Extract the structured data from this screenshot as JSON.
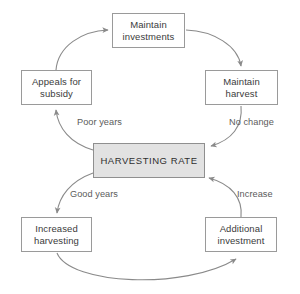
{
  "diagram": {
    "colors": {
      "background": "#ffffff",
      "node_fill": "#ffffff",
      "node_stroke": "#9a9a9a",
      "center_fill": "#e2e2e2",
      "center_stroke": "#8f8f8f",
      "edge_stroke": "#8a8a8a",
      "text": "#3b3b3b",
      "edge_label_text": "#5b5b5b"
    },
    "nodes": [
      {
        "id": "maintain-investments",
        "label": "Maintain\ninvestments",
        "type": "process",
        "x": 112,
        "y": 13,
        "w": 73,
        "h": 35
      },
      {
        "id": "appeals-for-subsidy",
        "label": "Appeals for\nsubsidy",
        "type": "process",
        "x": 21,
        "y": 70,
        "w": 71,
        "h": 35
      },
      {
        "id": "maintain-harvest",
        "label": "Maintain\nharvest",
        "type": "process",
        "x": 205,
        "y": 70,
        "w": 73,
        "h": 35
      },
      {
        "id": "harvesting-rate",
        "label": "HARVESTING RATE",
        "type": "central",
        "x": 93,
        "y": 143,
        "w": 112,
        "h": 35
      },
      {
        "id": "increased-harvesting",
        "label": "Increased\nharvesting",
        "type": "process",
        "x": 21,
        "y": 217,
        "w": 71,
        "h": 35
      },
      {
        "id": "additional-investment",
        "label": "Additional\ninvestment",
        "type": "process",
        "x": 205,
        "y": 217,
        "w": 72,
        "h": 35
      }
    ],
    "edges": [
      {
        "id": "appeals-to-investments",
        "from": "appeals-for-subsidy",
        "to": "maintain-investments",
        "label": "",
        "path": "M 56 70 C 58 46 82 31 108 30"
      },
      {
        "id": "investments-to-harvest",
        "from": "maintain-investments",
        "to": "maintain-harvest",
        "label": "",
        "path": "M 186 30 C 214 31 238 46 241 66"
      },
      {
        "id": "harvest-to-rate",
        "from": "maintain-harvest",
        "to": "harvesting-rate",
        "label": "No change",
        "path": "M 241 106 C 243 126 232 140 211 146"
      },
      {
        "id": "rate-to-appeals",
        "from": "harvesting-rate",
        "to": "appeals-for-subsidy",
        "label": "Poor years",
        "path": "M 93 150 C 70 143 58 128 56 110"
      },
      {
        "id": "rate-to-increased-harvesting",
        "from": "harvesting-rate",
        "to": "increased-harvesting",
        "label": "Good years",
        "path": "M 93 173 C 71 181 59 196 57 213"
      },
      {
        "id": "investment-to-rate",
        "from": "additional-investment",
        "to": "harvesting-rate",
        "label": "Increase",
        "path": "M 241 217 C 243 198 231 184 209 178"
      },
      {
        "id": "harvesting-to-investment",
        "from": "increased-harvesting",
        "to": "additional-investment",
        "label": "",
        "path": "M 57 253 C 70 285 185 290 236 259"
      }
    ],
    "edge_labels": [
      {
        "id": "poor-years",
        "text": "Poor years",
        "x": 77,
        "y": 117
      },
      {
        "id": "no-change",
        "text": "No change",
        "x": 229,
        "y": 117
      },
      {
        "id": "good-years",
        "text": "Good years",
        "x": 70,
        "y": 189
      },
      {
        "id": "increase",
        "text": "Increase",
        "x": 237,
        "y": 189
      }
    ]
  }
}
